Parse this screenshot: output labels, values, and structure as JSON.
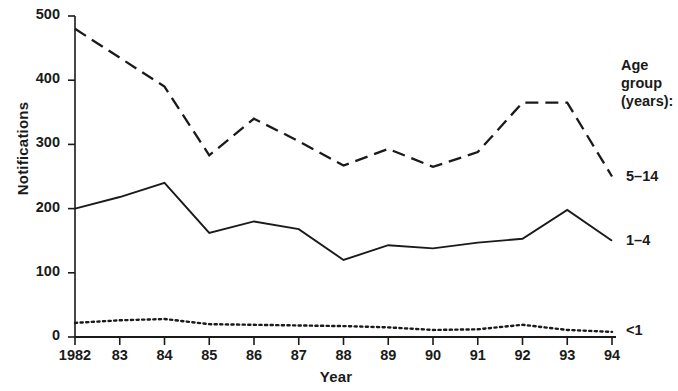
{
  "chart_data": {
    "type": "line",
    "title": "",
    "xlabel": "Year",
    "ylabel": "Notifications",
    "x": [
      1982,
      1983,
      1984,
      1985,
      1986,
      1987,
      1988,
      1989,
      1990,
      1991,
      1992,
      1993,
      1994
    ],
    "categories": [
      "1982",
      "83",
      "84",
      "85",
      "86",
      "87",
      "88",
      "89",
      "90",
      "91",
      "92",
      "93",
      "94"
    ],
    "xlim": [
      1982,
      1994
    ],
    "ylim": [
      0,
      500
    ],
    "yticks": [
      0,
      100,
      200,
      300,
      400,
      500
    ],
    "ytick_labels": [
      "0",
      "100",
      "200",
      "300",
      "400",
      "500"
    ],
    "grid": false,
    "legend_position": "right-inline",
    "legend_title_lines": [
      "Age",
      "group",
      "(years):"
    ],
    "series": [
      {
        "name": "5–14",
        "style": "dashed",
        "color": "#1a1a1a",
        "values": [
          480,
          435,
          390,
          283,
          340,
          305,
          267,
          293,
          265,
          288,
          365,
          365,
          250
        ]
      },
      {
        "name": "1–4",
        "style": "solid",
        "color": "#1a1a1a",
        "values": [
          200,
          218,
          240,
          162,
          180,
          168,
          120,
          143,
          138,
          147,
          153,
          198,
          150
        ]
      },
      {
        "name": "<1",
        "style": "dotted",
        "color": "#1a1a1a",
        "values": [
          22,
          26,
          28,
          20,
          19,
          18,
          17,
          15,
          11,
          12,
          19,
          11,
          8
        ]
      }
    ]
  },
  "axes": {
    "y_title": "Notifications",
    "x_title": "Year"
  }
}
